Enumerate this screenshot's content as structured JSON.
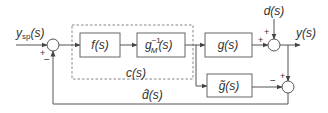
{
  "diagram": {
    "colors": {
      "line": "#555555",
      "text": "#333333",
      "box_border": "#666666",
      "dashed": "#777777"
    },
    "signals": {
      "setpoint": "y",
      "setpoint_sub": "sp",
      "setpoint_tail": "(s)",
      "disturbance": "d(s)",
      "output": "y(s)",
      "estimated_disturbance": "d̂(s)"
    },
    "blocks": {
      "filter": "f(s)",
      "inverse_model_main": "g",
      "inverse_model_sup": "−1",
      "inverse_model_sub": "M",
      "inverse_model_tail": "(s)",
      "plant": "g(s)",
      "model": "g̃(s)",
      "controller_group": "c(s)"
    },
    "signs": {
      "sum1_top": "+",
      "sum1_bottom": "−",
      "sum2_left": "+",
      "sum2_top": "+",
      "sum3_left": "−",
      "sum3_top": "+"
    }
  }
}
